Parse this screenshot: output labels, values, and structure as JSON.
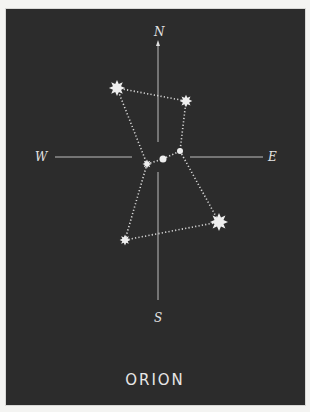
{
  "title": "ORION",
  "compass": {
    "north": "N",
    "south": "S",
    "west": "W",
    "east": "E"
  },
  "colors": {
    "background": "#2c2c2c",
    "star": "#eeeeee",
    "axis": "#bdbdbd",
    "frame": "#f4f4f2"
  },
  "stars": [
    {
      "name": "star-upper-left",
      "x": 117,
      "y": 88,
      "size": "large"
    },
    {
      "name": "star-upper-right",
      "x": 186,
      "y": 101,
      "size": "medium"
    },
    {
      "name": "belt-star-left",
      "x": 147,
      "y": 164,
      "size": "small"
    },
    {
      "name": "belt-star-middle",
      "x": 163,
      "y": 159,
      "size": "small"
    },
    {
      "name": "belt-star-right",
      "x": 180,
      "y": 151,
      "size": "tiny"
    },
    {
      "name": "star-lower-right",
      "x": 219,
      "y": 222,
      "size": "large"
    },
    {
      "name": "star-lower-left",
      "x": 125,
      "y": 240,
      "size": "small"
    }
  ]
}
